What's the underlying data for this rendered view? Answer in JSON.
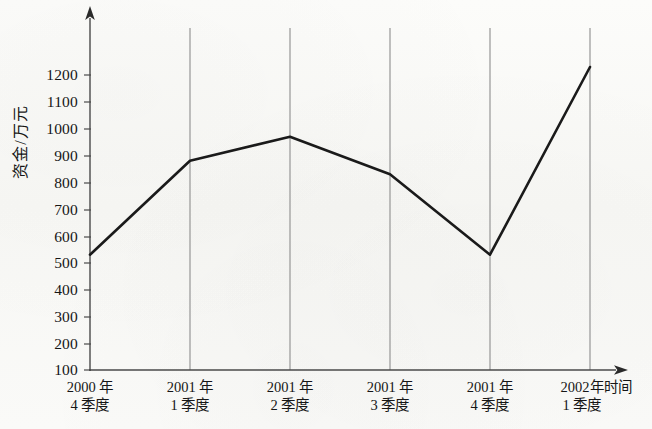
{
  "chart_data": {
    "type": "line",
    "title": "",
    "xlabel": "时间",
    "ylabel": "资金/万元",
    "categories": [
      "2000 年\n4 季度",
      "2001 年\n1 季度",
      "2001 年\n2 季度",
      "2001 年\n3 季度",
      "2001 年\n4 季度",
      "2002年\n1 季度"
    ],
    "category_lines": [
      [
        "2000 年",
        "4 季度"
      ],
      [
        "2001 年",
        "1 季度"
      ],
      [
        "2001 年",
        "2 季度"
      ],
      [
        "2001 年",
        "3 季度"
      ],
      [
        "2001 年",
        "4 季度"
      ],
      [
        "2002年",
        "1 季度"
      ]
    ],
    "values": [
      530,
      880,
      970,
      830,
      530,
      1230
    ],
    "series": [
      {
        "name": "资金",
        "values": [
          530,
          880,
          970,
          830,
          530,
          1230
        ]
      }
    ],
    "ylim": [
      100,
      1200
    ],
    "ytick_labels": [
      "1200",
      "1100",
      "1000",
      "900",
      "800",
      "700",
      "600",
      "500",
      "400",
      "300",
      "200",
      "100"
    ],
    "ytick_values": [
      1200,
      1100,
      1000,
      900,
      800,
      700,
      600,
      500,
      400,
      300,
      200,
      100
    ],
    "grid": "vertical-only",
    "legend": "none",
    "line_color": "#1a1a1a",
    "axis_color": "#4a4a4a",
    "gridline_color": "#8a8a8a",
    "background_color": "#fbfbf9"
  }
}
